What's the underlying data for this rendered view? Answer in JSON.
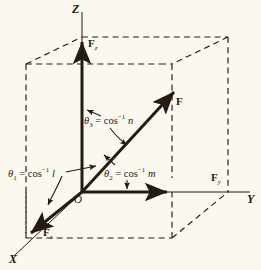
{
  "figure": {
    "background_color": "#faf8ef",
    "ink_color": "#241c14",
    "axes": [
      {
        "name": "z-axis",
        "label": "Z",
        "direction": "up"
      },
      {
        "name": "y-axis",
        "label": "Y",
        "direction": "right"
      },
      {
        "name": "x-axis",
        "label": "X",
        "direction": "down-left"
      }
    ],
    "origin_label": "O",
    "vectors": [
      {
        "name": "resultant-force",
        "label": "F",
        "sub": ""
      },
      {
        "name": "force-z-component",
        "label": "F",
        "sub": "z"
      },
      {
        "name": "force-y-component",
        "label": "F",
        "sub": "y"
      },
      {
        "name": "force-x-component",
        "label": "F",
        "sub": "x"
      }
    ],
    "angles": [
      {
        "name": "theta-1",
        "symbol": "θ",
        "subscript": "1",
        "equals": "=",
        "func": "cos",
        "exponent": "−1",
        "cosine": "l",
        "full": "θ1 = cos−1 l",
        "measured_from": "x-axis"
      },
      {
        "name": "theta-2",
        "symbol": "θ",
        "subscript": "2",
        "equals": "=",
        "func": "cos",
        "exponent": "−1",
        "cosine": "m",
        "full": "θ2 = cos−1 m",
        "measured_from": "y-axis"
      },
      {
        "name": "theta-3",
        "symbol": "θ",
        "subscript": "3",
        "equals": "=",
        "func": "cos",
        "exponent": "−1",
        "cosine": "n",
        "full": "θ3 = cos−1 n",
        "measured_from": "z-axis"
      }
    ],
    "box": {
      "name": "reference-box",
      "style": "dashed",
      "description": "dashed rectangular parallelepiped showing projections"
    }
  }
}
